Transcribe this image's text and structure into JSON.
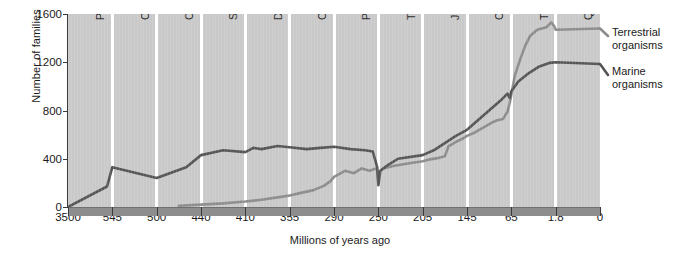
{
  "chart_data": {
    "type": "line",
    "title": "",
    "xlabel": "Millions of years ago",
    "ylabel": "Number of families",
    "ylim": [
      0,
      1600
    ],
    "yticks": [
      0,
      400,
      800,
      1200,
      1600
    ],
    "xticks": [
      "3500",
      "545",
      "500",
      "440",
      "410",
      "355",
      "290",
      "250",
      "205",
      "145",
      "65",
      "1.8",
      "0"
    ],
    "xtick_values": [
      3500,
      545,
      500,
      440,
      410,
      355,
      290,
      250,
      205,
      145,
      65,
      1.8,
      0
    ],
    "x_axis_note": "Non-linear (geologic period) axis; ticks evenly spaced by period boundary",
    "grid": false,
    "legend_position": "right",
    "periods": [
      "Pre-cambrian",
      "Cambrian",
      "Ordovician",
      "Silurian",
      "Devonian",
      "Carboniferous",
      "Permian",
      "Triassic",
      "Jurassic",
      "Cretaceous",
      "Tertiary",
      "Quaternary"
    ],
    "series": [
      {
        "name": "Marine organisms",
        "color": "#555555",
        "points": [
          [
            3500,
            0
          ],
          [
            900,
            170
          ],
          [
            545,
            330
          ],
          [
            500,
            240
          ],
          [
            460,
            330
          ],
          [
            440,
            430
          ],
          [
            425,
            470
          ],
          [
            410,
            455
          ],
          [
            400,
            490
          ],
          [
            390,
            480
          ],
          [
            370,
            505
          ],
          [
            355,
            495
          ],
          [
            330,
            480
          ],
          [
            310,
            490
          ],
          [
            290,
            500
          ],
          [
            275,
            480
          ],
          [
            262,
            470
          ],
          [
            255,
            460
          ],
          [
            251,
            330
          ],
          [
            250,
            180
          ],
          [
            248,
            300
          ],
          [
            240,
            350
          ],
          [
            230,
            400
          ],
          [
            205,
            430
          ],
          [
            190,
            470
          ],
          [
            175,
            530
          ],
          [
            160,
            590
          ],
          [
            145,
            640
          ],
          [
            130,
            700
          ],
          [
            115,
            760
          ],
          [
            100,
            820
          ],
          [
            85,
            880
          ],
          [
            72,
            940
          ],
          [
            68,
            905
          ],
          [
            65,
            960
          ],
          [
            55,
            1040
          ],
          [
            40,
            1110
          ],
          [
            25,
            1165
          ],
          [
            10,
            1195
          ],
          [
            1.8,
            1200
          ],
          [
            0,
            1185
          ]
        ]
      },
      {
        "name": "Terrestrial organisms",
        "color": "#8c8c8c",
        "points": [
          [
            470,
            10
          ],
          [
            440,
            20
          ],
          [
            425,
            30
          ],
          [
            410,
            45
          ],
          [
            390,
            60
          ],
          [
            370,
            80
          ],
          [
            355,
            95
          ],
          [
            340,
            115
          ],
          [
            320,
            140
          ],
          [
            305,
            175
          ],
          [
            295,
            215
          ],
          [
            290,
            250
          ],
          [
            280,
            300
          ],
          [
            272,
            280
          ],
          [
            265,
            320
          ],
          [
            258,
            300
          ],
          [
            252,
            320
          ],
          [
            251,
            300
          ],
          [
            250,
            215
          ],
          [
            249,
            290
          ],
          [
            245,
            320
          ],
          [
            235,
            340
          ],
          [
            220,
            360
          ],
          [
            205,
            380
          ],
          [
            195,
            395
          ],
          [
            185,
            405
          ],
          [
            175,
            420
          ],
          [
            170,
            505
          ],
          [
            165,
            520
          ],
          [
            160,
            540
          ],
          [
            150,
            570
          ],
          [
            145,
            590
          ],
          [
            130,
            620
          ],
          [
            115,
            660
          ],
          [
            100,
            700
          ],
          [
            90,
            720
          ],
          [
            80,
            730
          ],
          [
            72,
            790
          ],
          [
            68,
            860
          ],
          [
            65,
            930
          ],
          [
            60,
            1090
          ],
          [
            52,
            1230
          ],
          [
            45,
            1340
          ],
          [
            38,
            1420
          ],
          [
            28,
            1470
          ],
          [
            15,
            1490
          ],
          [
            8,
            1530
          ],
          [
            4,
            1500
          ],
          [
            1.8,
            1470
          ],
          [
            0,
            1480
          ]
        ]
      }
    ]
  },
  "legend": {
    "terrestrial_line1": "Terrestrial",
    "terrestrial_line2": "organisms",
    "marine_line1": "Marine",
    "marine_line2": "organisms"
  }
}
